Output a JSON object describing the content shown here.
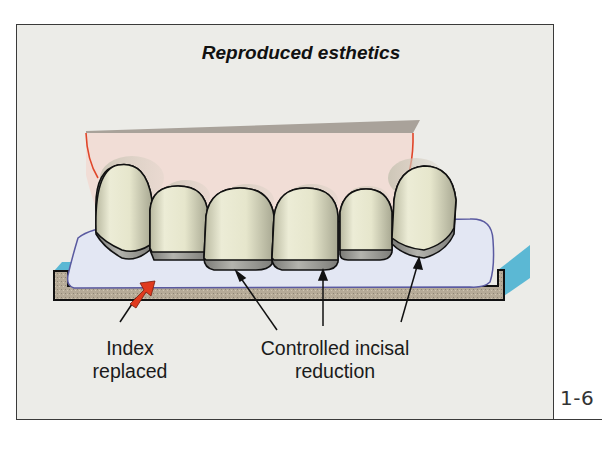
{
  "figure": {
    "title": "Reproduced esthetics",
    "number": "1-6",
    "labels": {
      "index_line1": "Index",
      "index_line2": "replaced",
      "reduction_line1": "Controlled incisal",
      "reduction_line2": "reduction"
    },
    "colors": {
      "background": "#ecece8",
      "frame": "#3a3a3a",
      "gingiva_block": "#f0dcd6",
      "gingiva_top": "#a9a29a",
      "gingiva_margin": "#e0462a",
      "tooth": "#e4e4c8",
      "incisal_edge": "#9a9a94",
      "index_putty": "#e2e6f2",
      "index_outline": "#5a5aa0",
      "tray": "#b8ad9a",
      "tray_side": "#5bb8d4",
      "indicator_arrow": "#e03a1e"
    },
    "teeth_count": 6,
    "arrows": [
      {
        "target": "index",
        "color": "red"
      },
      {
        "target": "central-incisor-left-edge",
        "color": "black"
      },
      {
        "target": "central-incisor-right-edge",
        "color": "black"
      },
      {
        "target": "canine-right-edge",
        "color": "black"
      }
    ]
  }
}
